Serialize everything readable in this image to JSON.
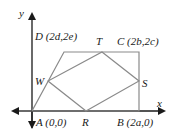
{
  "diagram": {
    "type": "coordinate-geometry",
    "axes": {
      "x_label": "x",
      "y_label": "y"
    },
    "points": {
      "A": {
        "name": "A",
        "coords": "(0,0)",
        "label": "A (0,0)"
      },
      "B": {
        "name": "B",
        "coords": "(2a,0)",
        "label": "B (2a,0)"
      },
      "C": {
        "name": "C",
        "coords": "(2b,2c)",
        "label": "C (2b,2c)"
      },
      "D": {
        "name": "D",
        "coords": "(2d,2e)",
        "label": "D (2d,2e)"
      },
      "R": {
        "name": "R",
        "label": "R"
      },
      "S": {
        "name": "S",
        "label": "S"
      },
      "T": {
        "name": "T",
        "label": "T"
      },
      "W": {
        "name": "W",
        "label": "W"
      }
    },
    "outer_quadrilateral": [
      "A",
      "B",
      "C",
      "D"
    ],
    "inner_quadrilateral": [
      "R",
      "S",
      "T",
      "W"
    ],
    "colors": {
      "shape_stroke": "#8a8a8a",
      "axis_stroke": "#1a1a1a",
      "text": "#1a1a1a"
    }
  }
}
